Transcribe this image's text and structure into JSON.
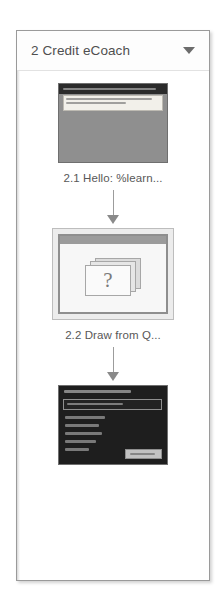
{
  "panel": {
    "header": {
      "title": "2 Credit eCoach",
      "dropdown_icon": "chevron-down-icon"
    }
  },
  "storyboard": {
    "slides": [
      {
        "id": "2.1",
        "caption": "2.1 Hello: %learn...",
        "selected": false,
        "thumbnail_type": "text-slide"
      },
      {
        "id": "2.2",
        "caption": "2.2 Draw from Q...",
        "selected": true,
        "thumbnail_type": "question-bank",
        "glyph": "?"
      },
      {
        "id": "2.3",
        "caption": "",
        "selected": false,
        "thumbnail_type": "quiz-slide"
      }
    ],
    "connector_icon": "arrow-down-icon"
  },
  "colors": {
    "panel_border": "#9a9a9a",
    "header_text": "#4f4f4f",
    "caption_text": "#585858",
    "selection_fill": "#ececec",
    "connector": "#8a8a8a"
  }
}
